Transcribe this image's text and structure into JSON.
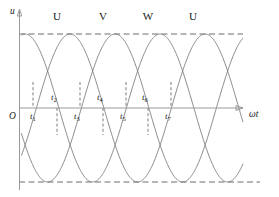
{
  "figure": {
    "name": "three-phase-voltage-waveform",
    "background_color": "#ffffff",
    "curve_color": "#7d7d7d",
    "axis_color": "#9a9a9a",
    "dash_color": "#6d6d6d",
    "text_color": "#1b1b1b"
  },
  "axes": {
    "y_label": "u",
    "x_label": "ωt",
    "origin_label": "O"
  },
  "phase_labels": [
    {
      "text": "U",
      "x": 57,
      "y": 20
    },
    {
      "text": "V",
      "x": 103,
      "y": 20
    },
    {
      "text": "W",
      "x": 148,
      "y": 20
    },
    {
      "text": "U",
      "x": 193,
      "y": 20
    }
  ],
  "time_markers": [
    {
      "label": "t",
      "sub": "1",
      "x": 33,
      "label_x": 30,
      "label_y": 119,
      "top_y": 82,
      "bottom_y": 108
    },
    {
      "label": "t",
      "sub": "2",
      "x": 57,
      "label_x": 51,
      "label_y": 100,
      "top_y": 108,
      "bottom_y": 135
    },
    {
      "label": "t",
      "sub": "3",
      "x": 80,
      "label_x": 74,
      "label_y": 119,
      "top_y": 82,
      "bottom_y": 108
    },
    {
      "label": "t",
      "sub": "4",
      "x": 103,
      "label_x": 97,
      "label_y": 100,
      "top_y": 108,
      "bottom_y": 135
    },
    {
      "label": "t",
      "sub": "5",
      "x": 126,
      "label_x": 120,
      "label_y": 119,
      "top_y": 82,
      "bottom_y": 108
    },
    {
      "label": "t",
      "sub": "6",
      "x": 148,
      "label_x": 142,
      "label_y": 100,
      "top_y": 108,
      "bottom_y": 135
    },
    {
      "label": "t",
      "sub": "7",
      "x": 171,
      "label_x": 165,
      "label_y": 119,
      "top_y": 82,
      "bottom_y": 108
    }
  ],
  "chart_data": {
    "type": "line",
    "title": "",
    "xlabel": "ωt",
    "ylabel": "u",
    "grid": false,
    "legend_position": "top",
    "x_range_degrees": [
      -40,
      640
    ],
    "ylim": [
      -1,
      1
    ],
    "amplitude": 1,
    "period_degrees": 360,
    "envelope_lines": [
      {
        "name": "positive-peak",
        "value": 1,
        "style": "dashed"
      },
      {
        "name": "negative-peak",
        "value": -1,
        "style": "dashed"
      }
    ],
    "series": [
      {
        "name": "U",
        "phase_degrees": 0,
        "color": "#7d7d7d",
        "formula": "sin(wt)"
      },
      {
        "name": "V",
        "phase_degrees": -120,
        "color": "#7d7d7d",
        "formula": "sin(wt - 120)"
      },
      {
        "name": "W",
        "phase_degrees": -240,
        "color": "#7d7d7d",
        "formula": "sin(wt - 240)"
      }
    ],
    "peak_labels": [
      "U",
      "V",
      "W",
      "U"
    ],
    "crossing_points": [
      "t1",
      "t2",
      "t3",
      "t4",
      "t5",
      "t6",
      "t7"
    ],
    "annotations": [
      "Three-phase sinusoidal voltages offset by 120 degrees",
      "t1..t7 mark successive phase-crossing instants"
    ]
  }
}
